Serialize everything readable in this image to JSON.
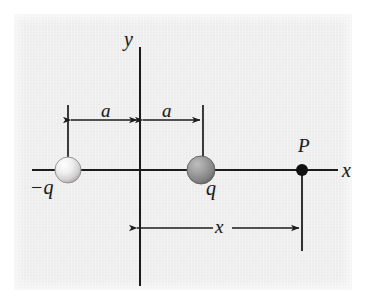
{
  "figure": {
    "kind": "physics-diagram",
    "background_color": "#e9e9e9",
    "ink_color": "#1c1c1c"
  },
  "axes": {
    "x_axis_label": "x",
    "y_axis_label": "y"
  },
  "charges": [
    {
      "id": "negative-charge",
      "label": "−q",
      "position_label": "−a",
      "sphere_color": "#eceaea",
      "sphere_shade": "#b9b7b7"
    },
    {
      "id": "positive-charge",
      "label": "q",
      "position_label": "a",
      "sphere_color": "#9d9d9d",
      "sphere_shade": "#6f6f6f"
    }
  ],
  "point": {
    "label": "P",
    "dot_color": "#111111"
  },
  "dimensions": [
    {
      "id": "a-left",
      "label": "a",
      "style": "double-arrow"
    },
    {
      "id": "a-right",
      "label": "a",
      "style": "double-arrow"
    },
    {
      "id": "x-dim",
      "label": "x",
      "style": "double-arrow"
    }
  ]
}
